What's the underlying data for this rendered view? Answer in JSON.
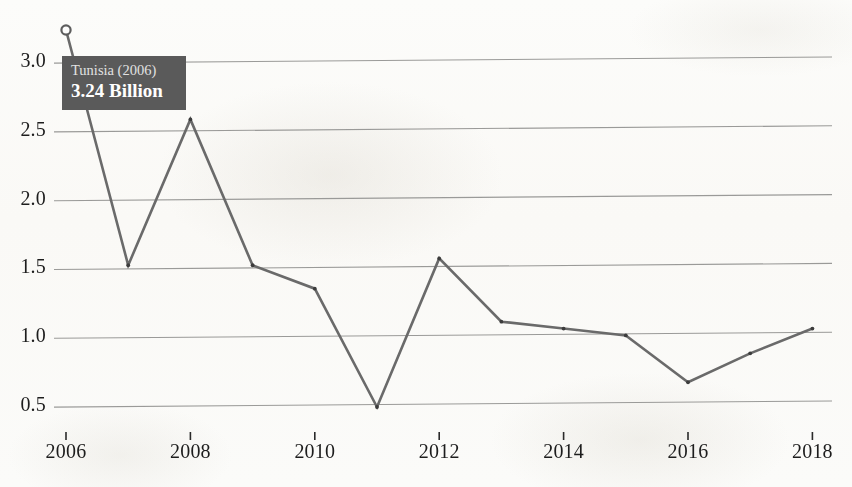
{
  "chart_data": {
    "type": "line",
    "title": "",
    "xlabel": "",
    "ylabel": "",
    "unit": "Billion",
    "grid": true,
    "legend": "none",
    "xlim": [
      2006,
      2018
    ],
    "ylim": [
      0.35,
      3.35
    ],
    "ytick_values": [
      0.5,
      1.0,
      1.5,
      2.0,
      2.5,
      3.0
    ],
    "ytick_labels": [
      "0.5",
      "1.0",
      "1.5",
      "2.0",
      "2.5",
      "3.0"
    ],
    "xtick_values": [
      2006,
      2008,
      2010,
      2012,
      2014,
      2016,
      2018
    ],
    "xtick_labels": [
      "2006",
      "2008",
      "2010",
      "2012",
      "2014",
      "2016",
      "2018"
    ],
    "x": [
      2006,
      2007,
      2008,
      2009,
      2010,
      2011,
      2012,
      2013,
      2014,
      2015,
      2016,
      2017,
      2018
    ],
    "values": [
      3.24,
      1.53,
      2.59,
      1.53,
      1.36,
      0.5,
      1.58,
      1.12,
      1.07,
      1.02,
      0.68,
      0.89,
      1.07
    ],
    "series": [
      {
        "name": "Tunisia",
        "values": [
          3.24,
          1.53,
          2.59,
          1.53,
          1.36,
          0.5,
          1.58,
          1.12,
          1.07,
          1.02,
          0.68,
          0.89,
          1.07
        ]
      }
    ],
    "line_color": "#6a6a6a",
    "grid_color": "#9a9a98",
    "highlight_point": {
      "x": 2006,
      "y": 3.24,
      "marker": "open-circle"
    }
  },
  "tooltip": {
    "title": "Tunisia (2006)",
    "value": "3.24 Billion",
    "background_color": "#5a5a5a",
    "text_color": "#ffffff"
  }
}
